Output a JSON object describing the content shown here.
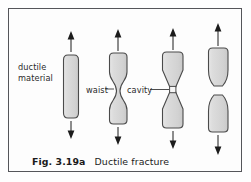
{
  "figure": {
    "caption_number": "Fig. 3.19a",
    "caption_text": "Ductile fracture",
    "border_color": "#55565a",
    "background_color": "#fdfdfd"
  },
  "labels": {
    "ductile_material": "ductile\nmaterial",
    "waist": "waist",
    "cavity": "cavity"
  },
  "specimen_style": {
    "fill_color": "#d6d6d6",
    "stroke_color": "#4a4a4a",
    "arrow_color": "#1c1c1c",
    "highlight_color": "#eeeeee"
  },
  "stages": [
    {
      "name": "stage-1-intact-bar",
      "description": "intact ductile bar under tension",
      "center_x": 71,
      "top_arrow": true,
      "bottom_arrow": true
    },
    {
      "name": "stage-2-waisting",
      "description": "bar begins to waist (neck)",
      "center_x": 118,
      "top_arrow": true,
      "bottom_arrow": true
    },
    {
      "name": "stage-3-cavity",
      "description": "severe necking with internal cavity forming",
      "center_x": 173,
      "top_arrow": true,
      "bottom_arrow": true
    },
    {
      "name": "stage-4-fractured",
      "description": "fully fractured into two cup-and-cone halves",
      "center_x": 218,
      "top_arrow": true,
      "bottom_arrow": true
    }
  ]
}
